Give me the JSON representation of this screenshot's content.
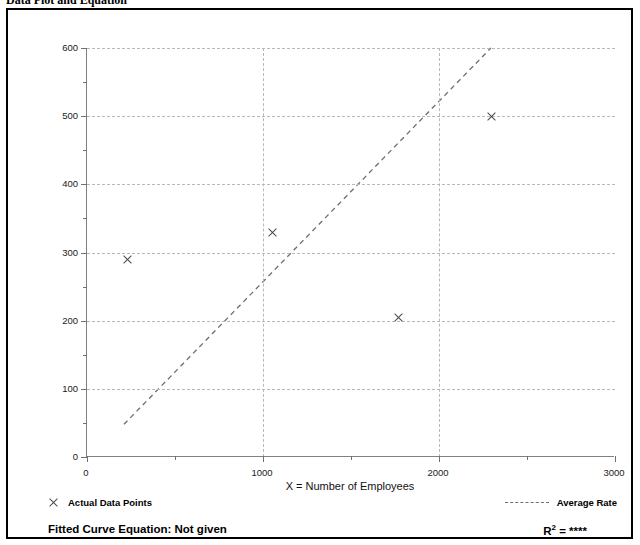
{
  "page_header": {
    "left_title": "Data Plot and Equation",
    "right_title": ""
  },
  "chart_data": {
    "type": "scatter",
    "title": "",
    "subtitle": "",
    "xlabel": "X = Number of Employees",
    "ylabel": "T = Average Vehicle Trip Ends",
    "xlim": [
      0,
      3000
    ],
    "ylim": [
      0,
      600
    ],
    "xticks": [
      0,
      1000,
      2000,
      3000
    ],
    "yticks": [
      0,
      100,
      200,
      300,
      400,
      500,
      600
    ],
    "xtick_labels": [
      "0",
      "1000",
      "2000",
      "3000"
    ],
    "ytick_labels": [
      "0",
      "100",
      "200",
      "300",
      "400",
      "500",
      "600"
    ],
    "grid": true,
    "legend_position": "below-plot",
    "series": [
      {
        "name": "Actual Data Points",
        "type": "scatter",
        "marker": "x",
        "color": "#4a4a4a",
        "points": [
          {
            "x": 230,
            "y": 290
          },
          {
            "x": 1055,
            "y": 330
          },
          {
            "x": 1770,
            "y": 205
          },
          {
            "x": 2300,
            "y": 500
          }
        ]
      },
      {
        "name": "Average Rate",
        "type": "line",
        "style": "dashed",
        "color": "#6e6e6e",
        "endpoints": [
          {
            "x": 210,
            "y": 48
          },
          {
            "x": 2295,
            "y": 600
          }
        ]
      }
    ],
    "annotations": {
      "fitted_curve_equation": "Fitted Curve Equation:  Not given",
      "r_squared": "****"
    }
  },
  "legend": {
    "actual_label": "Actual Data Points",
    "average_label": "Average Rate"
  },
  "footer": {
    "fitted_equation_label": "Fitted Curve Equation:  Not given",
    "r_label": "R",
    "r_exponent": "2",
    "r_equals": " = ",
    "r_value": "****"
  }
}
